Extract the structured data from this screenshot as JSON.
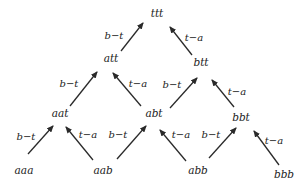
{
  "diagram": {
    "type": "tree",
    "colors": {
      "ink": "#222222",
      "background": "#ffffff"
    },
    "nodes": [
      {
        "id": "ttt",
        "label": "ttt",
        "x": 157,
        "y": 17
      },
      {
        "id": "att",
        "label": "att",
        "x": 111,
        "y": 62
      },
      {
        "id": "btt",
        "label": "btt",
        "x": 201,
        "y": 66
      },
      {
        "id": "aat",
        "label": "aat",
        "x": 60,
        "y": 117
      },
      {
        "id": "abt",
        "label": "abt",
        "x": 154,
        "y": 117
      },
      {
        "id": "bbt",
        "label": "bbt",
        "x": 241,
        "y": 121
      },
      {
        "id": "aaa",
        "label": "aaa",
        "x": 24,
        "y": 174
      },
      {
        "id": "aab",
        "label": "aab",
        "x": 103,
        "y": 174
      },
      {
        "id": "abb",
        "label": "abb",
        "x": 198,
        "y": 174
      },
      {
        "id": "bbb",
        "label": "bbb",
        "x": 284,
        "y": 178
      }
    ],
    "edges": [
      {
        "from": "att",
        "to": "ttt",
        "label": "b−t",
        "x1": 121,
        "y1": 51,
        "x2": 143,
        "y2": 23,
        "lx": 114,
        "ly": 39
      },
      {
        "from": "btt",
        "to": "ttt",
        "label": "t−a",
        "x1": 192,
        "y1": 55,
        "x2": 170,
        "y2": 27,
        "lx": 194,
        "ly": 41
      },
      {
        "from": "aat",
        "to": "att",
        "label": "b−t",
        "x1": 70,
        "y1": 106,
        "x2": 97,
        "y2": 72,
        "lx": 69,
        "ly": 87
      },
      {
        "from": "abt",
        "to": "att",
        "label": "t−a",
        "x1": 141,
        "y1": 106,
        "x2": 113,
        "y2": 73,
        "lx": 138,
        "ly": 87
      },
      {
        "from": "abt",
        "to": "btt",
        "label": "b−t",
        "x1": 170,
        "y1": 108,
        "x2": 197,
        "y2": 78,
        "lx": 172,
        "ly": 88
      },
      {
        "from": "bbt",
        "to": "btt",
        "label": "t−a",
        "x1": 234,
        "y1": 107,
        "x2": 212,
        "y2": 80,
        "lx": 237,
        "ly": 95
      },
      {
        "from": "aaa",
        "to": "aat",
        "label": "b−t",
        "x1": 28,
        "y1": 154,
        "x2": 53,
        "y2": 126,
        "lx": 26,
        "ly": 140
      },
      {
        "from": "aab",
        "to": "aat",
        "label": "t−a",
        "x1": 93,
        "y1": 160,
        "x2": 66,
        "y2": 127,
        "lx": 88,
        "ly": 138
      },
      {
        "from": "aab",
        "to": "abt",
        "label": "b−t",
        "x1": 117,
        "y1": 159,
        "x2": 146,
        "y2": 126,
        "lx": 118,
        "ly": 138
      },
      {
        "from": "abb",
        "to": "abt",
        "label": "t−a",
        "x1": 186,
        "y1": 161,
        "x2": 160,
        "y2": 130,
        "lx": 181,
        "ly": 138
      },
      {
        "from": "abb",
        "to": "bbt",
        "label": "b−t",
        "x1": 209,
        "y1": 158,
        "x2": 236,
        "y2": 128,
        "lx": 211,
        "ly": 138
      },
      {
        "from": "bbb",
        "to": "bbt",
        "label": "t−a",
        "x1": 279,
        "y1": 165,
        "x2": 254,
        "y2": 131,
        "lx": 274,
        "ly": 144
      }
    ]
  }
}
